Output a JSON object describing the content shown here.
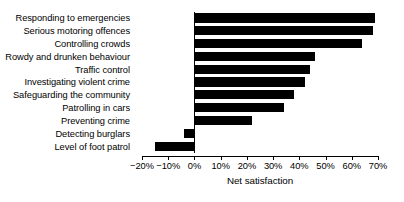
{
  "chart_data": {
    "type": "bar",
    "orientation": "horizontal",
    "title": "",
    "xlabel": "Net satisfaction",
    "ylabel": "",
    "xlim": [
      -20,
      70
    ],
    "xticks": [
      -20,
      -10,
      0,
      10,
      20,
      30,
      40,
      50,
      60,
      70
    ],
    "xtick_labels": [
      "−20%",
      "−10%",
      "0%",
      "10%",
      "20%",
      "30%",
      "40%",
      "50%",
      "60%",
      "70%"
    ],
    "grid": false,
    "legend": null,
    "bar_color": "#000000",
    "categories": [
      "Responding to emergencies",
      "Serious motoring offences",
      "Controlling crowds",
      "Rowdy and drunken behaviour",
      "Traffic control",
      "Investigating violent crime",
      "Safeguarding the community",
      "Patrolling in cars",
      "Preventing crime",
      "Detecting burglars",
      "Level of foot patrol"
    ],
    "values": [
      69,
      68,
      64,
      46,
      44,
      42,
      38,
      34,
      22,
      -4,
      -15
    ]
  }
}
